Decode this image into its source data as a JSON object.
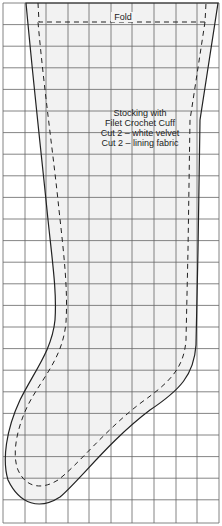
{
  "diagram": {
    "type": "sewing-pattern",
    "grid": {
      "columns": 10,
      "rows": 24,
      "line_color": "#555555",
      "cell_px": 21.6
    },
    "fold_label": "Fold",
    "instructions": {
      "lines": [
        "Stocking with",
        "Filet Crochet Cuff",
        "Cut 2 – white velvet",
        "Cut 2 – lining fabric"
      ]
    },
    "outline": {
      "cut_line": "solid",
      "seam_line": "dashed",
      "fill": "#f2f2f2",
      "stroke": "#222222"
    }
  }
}
